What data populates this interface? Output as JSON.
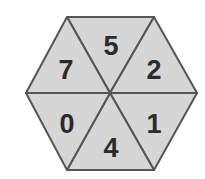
{
  "diagram": {
    "shape": "hexagon",
    "fill_color": "#d6d6d6",
    "stroke_color": "#555555",
    "text_color": "#2b2b2b",
    "segments": [
      {
        "position": "top",
        "label": "5"
      },
      {
        "position": "upper-right",
        "label": "2"
      },
      {
        "position": "lower-right",
        "label": "1"
      },
      {
        "position": "bottom",
        "label": "4"
      },
      {
        "position": "lower-left",
        "label": "0"
      },
      {
        "position": "upper-left",
        "label": "7"
      }
    ]
  }
}
